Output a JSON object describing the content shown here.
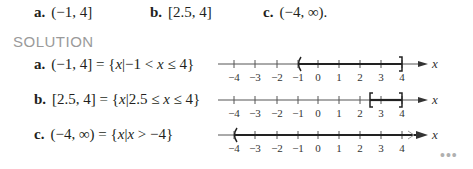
{
  "problem": {
    "items": [
      {
        "label": "a.",
        "interval": "(−1, 4]"
      },
      {
        "label": "b.",
        "interval": "[2.5, 4]"
      },
      {
        "label": "c.",
        "interval": "(−4, ∞)."
      }
    ]
  },
  "solution": {
    "heading": "SOLUTION",
    "rows": [
      {
        "label": "a.",
        "interval": "(−1, 4]",
        "equals": "=",
        "set_open": "{",
        "var": "x",
        "bar": "|",
        "condition_pre": "−1 < ",
        "condition_var": "x",
        "condition_post": " ≤ 4",
        "set_close": "}"
      },
      {
        "label": "b.",
        "interval": "[2.5, 4]",
        "equals": "=",
        "set_open": "{",
        "var": "x",
        "bar": "|",
        "condition_pre": "2.5 ≤ ",
        "condition_var": "x",
        "condition_post": " ≤ 4",
        "set_close": "}"
      },
      {
        "label": "c.",
        "interval": "(−4, ∞)",
        "equals": "=",
        "set_open": "{",
        "var": "x",
        "bar": "|",
        "condition_pre": "",
        "condition_var": "x",
        "condition_post": " > −4",
        "set_close": "}"
      }
    ]
  },
  "number_line": {
    "tick_labels": [
      "−4",
      "−3",
      "−2",
      "−1",
      "0",
      "1",
      "2",
      "3",
      "4"
    ],
    "axis_label": "x"
  },
  "more_menu": {
    "label": "•••"
  }
}
